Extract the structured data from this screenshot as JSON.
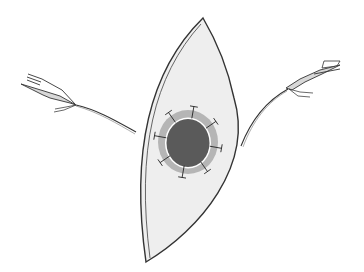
{
  "figure": {
    "elements": {
      "skin_ellipse": "elliptical-skin-flap",
      "wound": "circular-wound-defect",
      "ring": "wound-margin-ring",
      "sutures": "interrupted-sutures",
      "left_instrument": "left-needle-holder",
      "right_instrument": "right-needle-holder"
    },
    "suture_count": 8,
    "colors": {
      "skin_fill": "#eeeeee",
      "outline": "#333333",
      "wound_fill": "#5a5a5a",
      "ring_fill": "#b5b5b5",
      "margin_highlight": "#ffffff",
      "thread": "#3a3a3a",
      "instrument_fill": "#d8d8d8"
    }
  }
}
